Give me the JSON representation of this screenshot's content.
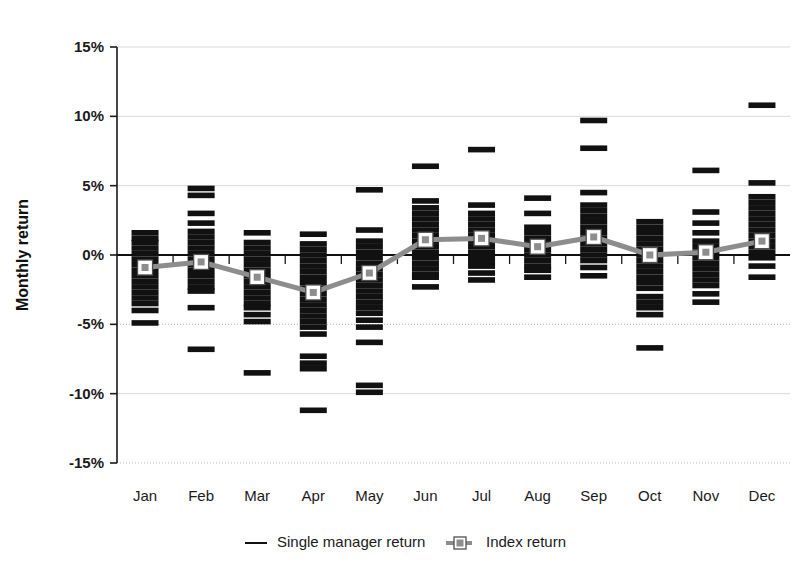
{
  "chart_data": {
    "type": "bar",
    "title": "",
    "xlabel": "",
    "ylabel": "Monthly return",
    "ylim": [
      -15,
      15
    ],
    "ytick_values": [
      15,
      10,
      5,
      0,
      -5,
      -10,
      -15
    ],
    "ytick_labels": [
      "15%",
      "10%",
      "5%",
      "0%",
      "-5%",
      "-10%",
      "-15%"
    ],
    "categories": [
      "Jan",
      "Feb",
      "Mar",
      "Apr",
      "May",
      "Jun",
      "Jul",
      "Aug",
      "Sep",
      "Oct",
      "Nov",
      "Dec"
    ],
    "grid": true,
    "legend_position": "bottom",
    "series": [
      {
        "name": "Single manager return",
        "type": "dash-scatter",
        "color": "#111111",
        "values_by_category": {
          "Jan": [
            1.6,
            1.2,
            0.9,
            0.5,
            0.1,
            -0.3,
            -0.7,
            -1.1,
            -1.5,
            -1.9,
            -2.3,
            -2.7,
            -3.1,
            -3.5,
            -4.0,
            -4.9
          ],
          "Feb": [
            4.8,
            4.3,
            3.0,
            2.3,
            1.7,
            1.3,
            0.9,
            0.5,
            0.1,
            -0.3,
            -0.7,
            -1.1,
            -1.5,
            -1.9,
            -2.3,
            -2.6,
            -3.8,
            -6.8
          ],
          "Mar": [
            1.6,
            0.9,
            0.5,
            0.1,
            -0.3,
            -0.7,
            -1.1,
            -1.5,
            -1.9,
            -2.3,
            -2.7,
            -3.1,
            -3.5,
            -3.8,
            -4.3,
            -4.8,
            -8.5
          ],
          "Apr": [
            1.5,
            0.8,
            0.4,
            0.0,
            -0.4,
            -0.8,
            -1.2,
            -1.6,
            -2.0,
            -2.4,
            -2.8,
            -3.2,
            -3.6,
            -4.0,
            -4.4,
            -4.8,
            -5.2,
            -5.7,
            -7.3,
            -7.8,
            -8.2,
            -11.2
          ],
          "May": [
            4.7,
            1.8,
            1.0,
            0.6,
            0.2,
            -0.2,
            -0.6,
            -1.0,
            -1.4,
            -1.8,
            -2.2,
            -2.6,
            -3.0,
            -3.4,
            -3.8,
            -4.2,
            -4.7,
            -5.2,
            -6.3,
            -9.4,
            -9.9
          ],
          "Jun": [
            6.4,
            3.9,
            3.4,
            3.0,
            2.6,
            2.2,
            1.8,
            1.4,
            1.0,
            0.6,
            0.2,
            -0.2,
            -0.6,
            -1.0,
            -1.4,
            -1.6,
            -2.3
          ],
          "Jul": [
            7.6,
            3.6,
            3.0,
            2.6,
            2.2,
            1.8,
            1.4,
            1.0,
            0.6,
            0.2,
            -0.2,
            -0.5,
            -0.8,
            -1.3,
            -1.8
          ],
          "Aug": [
            4.1,
            3.0,
            2.0,
            1.6,
            1.2,
            0.8,
            0.4,
            0.0,
            -0.4,
            -0.8,
            -1.1,
            -1.6
          ],
          "Sep": [
            9.7,
            7.7,
            4.5,
            3.6,
            3.2,
            2.8,
            2.4,
            2.0,
            1.6,
            1.2,
            0.8,
            0.4,
            0.0,
            -0.4,
            -0.9,
            -1.5
          ],
          "Oct": [
            2.4,
            2.0,
            1.6,
            1.2,
            0.8,
            0.4,
            0.0,
            -0.4,
            -0.8,
            -1.2,
            -1.6,
            -2.0,
            -2.4,
            -3.0,
            -3.4,
            -3.8,
            -4.3,
            -6.7
          ],
          "Nov": [
            6.1,
            3.1,
            2.3,
            1.6,
            1.0,
            0.6,
            0.2,
            -0.2,
            -0.6,
            -1.0,
            -1.4,
            -1.8,
            -2.2,
            -2.8,
            -3.4
          ],
          "Dec": [
            10.8,
            5.2,
            4.2,
            3.8,
            3.4,
            3.0,
            2.6,
            2.2,
            1.8,
            1.4,
            1.0,
            0.6,
            0.2,
            -0.2,
            -0.8,
            -1.6
          ]
        }
      },
      {
        "name": "Index return",
        "type": "line",
        "color": "#8d8d8d",
        "values": [
          -0.9,
          -0.5,
          -1.6,
          -2.7,
          -1.3,
          1.1,
          1.2,
          0.6,
          1.3,
          0.0,
          0.2,
          1.0
        ]
      }
    ]
  },
  "legend": {
    "items": [
      {
        "label": "Single manager return",
        "icon": "line-swatch",
        "color": "#111111"
      },
      {
        "label": "Index return",
        "icon": "line-marker-swatch",
        "color": "#8d8d8d"
      }
    ]
  }
}
